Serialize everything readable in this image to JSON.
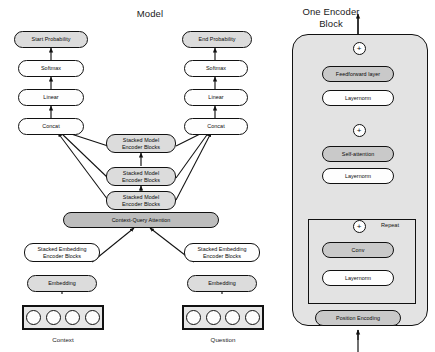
{
  "figure": {
    "left_title": "Model",
    "right_title_line1": "One Encoder",
    "right_title_line2": "Block"
  },
  "colors": {
    "box_stroke": "#111111",
    "fill_white": "#fefefe",
    "fill_light": "#dcdcdc",
    "fill_mid": "#c9c9c9",
    "fill_dark": "#bdbdbd",
    "panel_fill": "#e3e3e3",
    "background": "#ffffff"
  },
  "model": {
    "left_stack": [
      {
        "label": "Start Probability",
        "style": "shaded"
      },
      {
        "label": "Softmax",
        "style": "plain"
      },
      {
        "label": "Linear",
        "style": "plain"
      },
      {
        "label": "Concat",
        "style": "plain"
      }
    ],
    "right_stack": [
      {
        "label": "End Probability",
        "style": "shaded"
      },
      {
        "label": "Softmax",
        "style": "plain"
      },
      {
        "label": "Linear",
        "style": "plain"
      },
      {
        "label": "Concat",
        "style": "plain"
      }
    ],
    "model_encoders": [
      {
        "line1": "Stacked Model",
        "line2": "Encoder Blocks"
      },
      {
        "line1": "Stacked Model",
        "line2": "Encoder Blocks"
      },
      {
        "line1": "Stacked Model",
        "line2": "Encoder Blocks"
      }
    ],
    "attention": {
      "label": "Context-Query Attention"
    },
    "inputs": [
      {
        "encoder_line1": "Stacked Embedding",
        "encoder_line2": "Encoder Blocks",
        "embedding": "Embedding",
        "caption": "Context",
        "token_count": 4
      },
      {
        "encoder_line1": "Stacked Embedding",
        "encoder_line2": "Encoder Blocks",
        "embedding": "Embedding",
        "caption": "Question",
        "token_count": 4
      }
    ]
  },
  "encoder_block": {
    "layers": [
      {
        "label": "Feedforward layer",
        "style": "shaded"
      },
      {
        "label": "Layernorm",
        "style": "plain"
      },
      {
        "label": "Self-attention",
        "style": "shaded"
      },
      {
        "label": "Layernorm",
        "style": "plain"
      },
      {
        "label": "Conv",
        "style": "shaded"
      },
      {
        "label": "Layernorm",
        "style": "plain"
      },
      {
        "label": "Position Encoding",
        "style": "shaded"
      }
    ],
    "residual_adds": [
      {
        "symbol": "+",
        "name": "add-feedforward"
      },
      {
        "symbol": "+",
        "name": "add-selfattention"
      },
      {
        "symbol": "+",
        "name": "add-conv"
      }
    ],
    "repeat_label": "Repeat"
  }
}
